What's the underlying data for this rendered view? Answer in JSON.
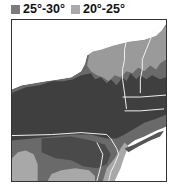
{
  "map": {
    "title": "Temperature zones",
    "legend": [
      {
        "label": "25°-30°",
        "color": "#7b7b7b"
      },
      {
        "label": "20°-25°",
        "color": "#aaaaaa"
      }
    ],
    "colors": {
      "zone_dark": "#3f3f3f",
      "zone_mid": "#6a6a6a",
      "zone_light": "#a8a8a8",
      "water": "#ffffff",
      "border": "#f2f2f2"
    }
  }
}
